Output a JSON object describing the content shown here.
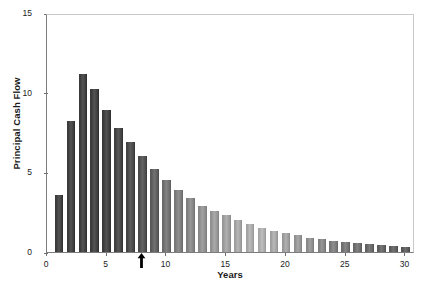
{
  "chart_data": {
    "type": "bar",
    "title": "",
    "xlabel": "Years",
    "ylabel": "Principal Cash Flow",
    "xlim": [
      0,
      30.8
    ],
    "ylim": [
      0,
      15
    ],
    "grid": false,
    "legend": null,
    "xticks": [
      0,
      5,
      10,
      15,
      20,
      25,
      30
    ],
    "xticklabels": [
      "0",
      "5",
      "10",
      "15",
      "20",
      "25",
      "30"
    ],
    "yticks": [
      0,
      5,
      10,
      15
    ],
    "yticklabels": [
      "0",
      "5",
      "10",
      "15"
    ],
    "categories": [
      1,
      2,
      3,
      4,
      5,
      6,
      7,
      8,
      9,
      10,
      11,
      12,
      13,
      14,
      15,
      16,
      17,
      18,
      19,
      20,
      21,
      22,
      23,
      24,
      25,
      26,
      27,
      28,
      29,
      30
    ],
    "values": [
      3.6,
      8.2,
      11.2,
      10.2,
      8.9,
      7.8,
      6.9,
      6.0,
      5.2,
      4.5,
      3.9,
      3.4,
      2.9,
      2.6,
      2.3,
      2.0,
      1.75,
      1.5,
      1.35,
      1.2,
      1.05,
      0.9,
      0.8,
      0.7,
      0.62,
      0.55,
      0.48,
      0.42,
      0.36,
      0.32
    ],
    "bar_colors": [
      "#3a3a3a",
      "#3a3a3a",
      "#3a3a3a",
      "#3a3a3a",
      "#3a3a3a",
      "#3e3e3e",
      "#434343",
      "#4a4a4a",
      "#585858",
      "#6a6a6a",
      "#767676",
      "#7f7f7f",
      "#888888",
      "#909090",
      "#979797",
      "#9d9d9d",
      "#a2a2a2",
      "#a5a5a5",
      "#9e9e9e",
      "#979797",
      "#8f8f8f",
      "#878787",
      "#7e7e7e",
      "#757575",
      "#6d6d6d",
      "#676767",
      "#616161",
      "#5c5c5c",
      "#585858",
      "#545454"
    ],
    "annotations": [
      {
        "name": "year-marker-arrow",
        "shape": "up-arrow",
        "x": 8.0,
        "y": 0,
        "color": "#000000"
      }
    ]
  },
  "axis_colors": {
    "spine": "#7d7d7d",
    "frame_light": "#c9c9c9",
    "tick": "#6e6e6e",
    "text": "#1a1a1a"
  }
}
